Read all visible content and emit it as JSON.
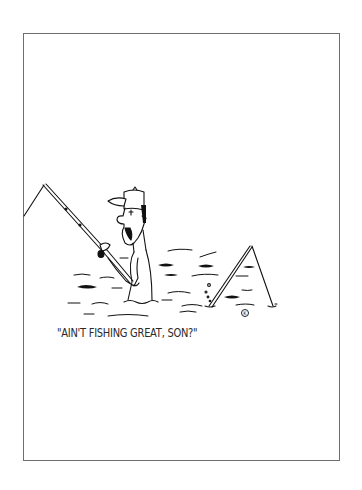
{
  "cartoon": {
    "caption": "\"AIN'T FISHING GREAT, SON?\"",
    "signature_glyph": "K",
    "scene": {
      "main_figure": "man in baseball cap wading in water, smiling, holding fishing rod",
      "second_rod": "fishing rod sticking up from water with bubbles rising beside it",
      "water": "wavy lines and dark ripple strokes"
    },
    "colors": {
      "ink": "#111111",
      "paper": "#ffffff",
      "border": "#6e6e6e"
    }
  }
}
